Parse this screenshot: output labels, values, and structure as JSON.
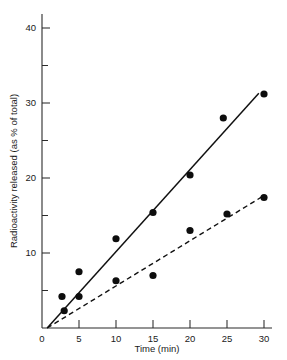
{
  "chart_data": {
    "type": "scatter",
    "title": "",
    "xlabel": "Time (min)",
    "ylabel": "Radioactivity released (as % of total)",
    "xlim": [
      0,
      31
    ],
    "ylim": [
      0,
      41
    ],
    "xticks": [
      0,
      5,
      10,
      15,
      20,
      25,
      30
    ],
    "xtick_labels": [
      "0",
      "5",
      "10",
      "15",
      "20",
      "25",
      "30"
    ],
    "yticks": [
      10,
      20,
      30,
      40
    ],
    "ytick_labels": [
      "10",
      "20",
      "30",
      "40"
    ],
    "yminor_ticks": [
      5,
      15,
      25,
      35
    ],
    "grid": false,
    "legend": "none",
    "series": [
      {
        "name": "upper",
        "line_style": "solid",
        "marker": "filled-circle",
        "fit_line": {
          "x0": 0.7,
          "y0": 0.0,
          "x1": 29.3,
          "y1": 31.3
        },
        "points": [
          {
            "x": 2.7,
            "y": 4.2
          },
          {
            "x": 3.0,
            "y": 2.3
          },
          {
            "x": 5.0,
            "y": 7.5
          },
          {
            "x": 10.0,
            "y": 11.9
          },
          {
            "x": 15.0,
            "y": 15.4
          },
          {
            "x": 20.0,
            "y": 20.4
          },
          {
            "x": 24.5,
            "y": 28.0
          },
          {
            "x": 30.0,
            "y": 31.2
          }
        ]
      },
      {
        "name": "lower",
        "line_style": "dashed",
        "marker": "filled-circle",
        "fit_line": {
          "x0": 0.7,
          "y0": 0.0,
          "x1": 29.9,
          "y1": 17.6
        },
        "points": [
          {
            "x": 5.0,
            "y": 4.2
          },
          {
            "x": 10.0,
            "y": 6.3
          },
          {
            "x": 15.0,
            "y": 7.0
          },
          {
            "x": 20.0,
            "y": 13.0
          },
          {
            "x": 25.0,
            "y": 15.2
          },
          {
            "x": 30.0,
            "y": 17.4
          }
        ]
      }
    ]
  },
  "axes": {
    "x_title": "Time (min)",
    "y_title": "Radioactivity released (as % of total)"
  }
}
